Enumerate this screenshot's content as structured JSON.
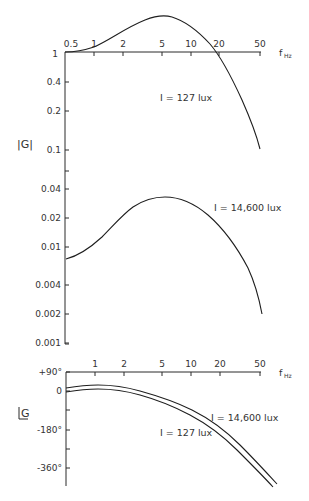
{
  "chart_data": [
    {
      "type": "line",
      "title": "",
      "xlabel": "f_Hz",
      "ylabel": "|G|",
      "x_scale": "log",
      "y_scale": "log",
      "x_ticks": [
        "0.5",
        "1",
        "2",
        "5",
        "10",
        "20",
        "50"
      ],
      "y_ticks": [
        "1",
        "0.4",
        "0.2",
        "0.1",
        "0.04",
        "0.02",
        "0.01",
        "0.004",
        "0.002",
        "0.001"
      ],
      "xlim": [
        0.5,
        50
      ],
      "ylim": [
        0.001,
        1
      ],
      "grid": false,
      "series": [
        {
          "name": "I = 127 lux",
          "x": [
            0.5,
            0.7,
            1,
            1.5,
            2,
            3,
            5,
            7,
            10,
            15,
            20,
            30,
            50
          ],
          "y": [
            1.0,
            1.05,
            1.2,
            1.55,
            1.85,
            2.3,
            2.6,
            2.4,
            2.0,
            1.35,
            0.95,
            0.45,
            0.1
          ]
        },
        {
          "name": "I = 14,600 lux",
          "x": [
            0.5,
            0.7,
            1,
            1.5,
            2,
            3,
            5,
            7,
            10,
            15,
            20,
            30,
            50
          ],
          "y": [
            0.0075,
            0.0085,
            0.011,
            0.016,
            0.021,
            0.028,
            0.033,
            0.032,
            0.028,
            0.02,
            0.014,
            0.0075,
            0.002
          ]
        }
      ]
    },
    {
      "type": "line",
      "title": "",
      "xlabel": "f_Hz",
      "ylabel": "∠G",
      "x_scale": "log",
      "x_ticks": [
        "1",
        "2",
        "5",
        "10",
        "20",
        "50"
      ],
      "y_ticks": [
        "+90°",
        "0",
        "-180°",
        "-360°"
      ],
      "xlim": [
        0.5,
        60
      ],
      "ylim": [
        -420,
        90
      ],
      "grid": false,
      "series": [
        {
          "name": "I = 14,600 lux",
          "x": [
            0.5,
            1,
            2,
            5,
            10,
            20,
            50,
            60
          ],
          "y": [
            15,
            30,
            20,
            -25,
            -90,
            -180,
            -370,
            -410
          ]
        },
        {
          "name": "I = 127 lux",
          "x": [
            0.5,
            1,
            2,
            5,
            10,
            20,
            50,
            60
          ],
          "y": [
            0,
            12,
            2,
            -45,
            -110,
            -200,
            -385,
            -420
          ]
        }
      ]
    }
  ],
  "labels": {
    "mag_ylabel": "|G|",
    "phase_ylabel": "G",
    "freq_label_f": "f",
    "freq_label_sub": "Hz",
    "top_label_127": "I = 127 lux",
    "mid_label_14600": "I = 14,600 lux",
    "phase_label_14600": "I = 14,600 lux",
    "phase_label_127": "I = 127 lux"
  },
  "mag_axis": {
    "x_ticks": [
      {
        "label": "0.5",
        "x": 65
      },
      {
        "label": "1",
        "x": 94
      },
      {
        "label": "2",
        "x": 123
      },
      {
        "label": "5",
        "x": 162
      },
      {
        "label": "10",
        "x": 191
      },
      {
        "label": "20",
        "x": 219
      },
      {
        "label": "50",
        "x": 260
      }
    ],
    "y_ticks": [
      {
        "label": "1",
        "y": 52
      },
      {
        "label": "0.4",
        "y": 82
      },
      {
        "label": "0.2",
        "y": 111
      },
      {
        "label": "0.1",
        "y": 150
      },
      {
        "label": "",
        "y": 171
      },
      {
        "label": "0.04",
        "y": 189
      },
      {
        "label": "0.02",
        "y": 218
      },
      {
        "label": "0.01",
        "y": 247
      },
      {
        "label": "0.004",
        "y": 285
      },
      {
        "label": "0.002",
        "y": 314
      },
      {
        "label": "0.001",
        "y": 343
      }
    ]
  },
  "phase_axis": {
    "x_ticks": [
      {
        "label": "1",
        "x": 95
      },
      {
        "label": "2",
        "x": 124
      },
      {
        "label": "5",
        "x": 162
      },
      {
        "label": "10",
        "x": 191
      },
      {
        "label": "20",
        "x": 220
      },
      {
        "label": "50",
        "x": 260
      }
    ],
    "y_ticks": [
      {
        "label": "+90°",
        "y": 372
      },
      {
        "label": "0",
        "y": 391
      },
      {
        "label": "",
        "y": 410
      },
      {
        "label": "-180°",
        "y": 430
      },
      {
        "label": "",
        "y": 449
      },
      {
        "label": "-360°",
        "y": 468
      }
    ]
  }
}
